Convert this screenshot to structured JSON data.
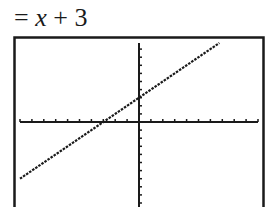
{
  "equation": {
    "prefix": "= ",
    "variable": "x",
    "suffix": " + 3"
  },
  "chart_data": {
    "type": "line",
    "function": "y = x + 3",
    "slope": 1,
    "intercept": 3,
    "x_intercept": -3,
    "xlim": [
      -10,
      10
    ],
    "ylim": [
      -10,
      10
    ],
    "xscl": 1,
    "yscl": 1,
    "grid": false,
    "series": [
      {
        "name": "Y1",
        "x": [
          -10,
          10
        ],
        "y": [
          -7,
          13
        ]
      }
    ]
  },
  "colors": {
    "ink": "#1a1a1a",
    "background": "#ffffff"
  }
}
